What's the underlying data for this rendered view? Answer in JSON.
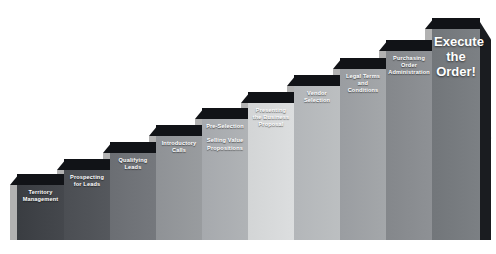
{
  "diagram": {
    "type": "ascending-staircase",
    "background_color": "#ffffff",
    "cap_color": "#111317",
    "label_color": "#ffffff",
    "trendline_color": "#f2f2f2"
  },
  "steps": [
    {
      "index": 1,
      "label": "Territory\nManagement",
      "fill": "#3a3d42",
      "fill_right": "#45484d",
      "x": 17,
      "width": 47,
      "top": 174,
      "bottom": 240
    },
    {
      "index": 2,
      "label": "Prospecting\nfor Leads",
      "fill": "#4b4e53",
      "fill_right": "#55585d",
      "x": 64,
      "width": 46,
      "top": 159,
      "bottom": 240
    },
    {
      "index": 3,
      "label": "Qualifying\nLeads",
      "fill": "#6b6e73",
      "fill_right": "#75787d",
      "x": 110,
      "width": 46,
      "top": 142,
      "bottom": 240
    },
    {
      "index": 4,
      "label": "Introductory\nCalls",
      "fill": "#8f9296",
      "fill_right": "#999c9f",
      "x": 156,
      "width": 46,
      "top": 125,
      "bottom": 240
    },
    {
      "index": 5,
      "label": "Pre-Selection\n\nSelling Value\nPropositions",
      "fill": "#a6a9ad",
      "fill_right": "#b0b3b6",
      "x": 202,
      "width": 46,
      "top": 108,
      "bottom": 240
    },
    {
      "index": 6,
      "label": "Presenting\nthe Business\nProposal",
      "fill": "#d3d5d6",
      "fill_right": "#dcdedf",
      "x": 248,
      "width": 46,
      "top": 92,
      "bottom": 240
    },
    {
      "index": 7,
      "label": "Vendor\nSelection",
      "fill": "#b3b6b9",
      "fill_right": "#bcbfc1",
      "x": 294,
      "width": 46,
      "top": 75,
      "bottom": 240
    },
    {
      "index": 8,
      "label": "Legal Terms\nand Conditions",
      "fill": "#9a9da1",
      "fill_right": "#a4a7aa",
      "x": 340,
      "width": 46,
      "top": 58,
      "bottom": 240
    },
    {
      "index": 9,
      "label": "Purchasing\nOrder\nAdministration",
      "fill": "#84878b",
      "fill_right": "#8e9195",
      "x": 386,
      "width": 46,
      "top": 40,
      "bottom": 240
    },
    {
      "index": 10,
      "label": "Execute\nthe\nOrder!",
      "fill": "#72767a",
      "fill_right": "#7c8084",
      "x": 432,
      "width": 48,
      "top": 18,
      "bottom": 240,
      "big_text": true,
      "has_side_face": true
    }
  ],
  "trendline": {
    "x1": 58,
    "y1": 190,
    "x2": 492,
    "y2": 138
  }
}
